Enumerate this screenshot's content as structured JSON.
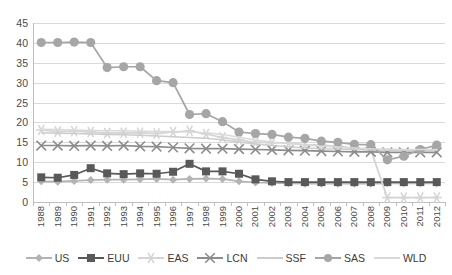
{
  "chart_data": {
    "type": "line",
    "title": "",
    "xlabel": "",
    "ylabel": "",
    "ylim": [
      0,
      45
    ],
    "ytick_step": 5,
    "grid": true,
    "legend_position": "bottom",
    "yticks": [
      "45",
      "40",
      "35",
      "30",
      "25",
      "20",
      "15",
      "10",
      "5",
      "0"
    ],
    "categories": [
      "1988",
      "1989",
      "1990",
      "1991",
      "1992",
      "1993",
      "1994",
      "1995",
      "1996",
      "1997",
      "1998",
      "1999",
      "2000",
      "2001",
      "2002",
      "2003",
      "2004",
      "2005",
      "2006",
      "2007",
      "2008",
      "2009",
      "2010",
      "2011",
      "2012"
    ],
    "series": [
      {
        "name": "US",
        "marker": "diamond",
        "color": "#b3b3b3",
        "values": [
          5.2,
          5.1,
          5.3,
          5.5,
          5.6,
          5.6,
          5.7,
          5.8,
          5.6,
          5.8,
          5.9,
          5.8,
          5.2,
          4.9,
          4.8,
          4.7,
          4.6,
          4.6,
          4.6,
          4.6,
          4.6,
          4.7,
          4.7,
          4.7,
          4.7
        ]
      },
      {
        "name": "EUU",
        "marker": "square",
        "color": "#595959",
        "values": [
          6.2,
          6.1,
          6.8,
          8.5,
          7.2,
          7.0,
          7.2,
          7.1,
          7.6,
          9.6,
          7.7,
          7.7,
          7.1,
          5.7,
          5.2,
          5.0,
          5.0,
          5.0,
          5.0,
          5.0,
          5.0,
          5.0,
          5.0,
          5.0,
          5.0
        ]
      },
      {
        "name": "EAS",
        "marker": "star",
        "color": "#d4d4d4",
        "values": [
          18.1,
          17.7,
          17.8,
          17.6,
          17.3,
          17.4,
          17.4,
          17.2,
          17.6,
          17.9,
          17.1,
          16.2,
          15.6,
          15.0,
          14.9,
          14.8,
          14.4,
          14.3,
          14.0,
          13.5,
          13.1,
          1.1,
          1.1,
          1.1,
          1.1
        ]
      },
      {
        "name": "LCN",
        "marker": "cross",
        "color": "#8c8c8c",
        "values": [
          14.2,
          14.2,
          14.1,
          14.2,
          14.1,
          14.2,
          14.0,
          13.9,
          13.7,
          13.5,
          13.4,
          13.4,
          13.3,
          13.2,
          13.1,
          13.0,
          12.9,
          12.8,
          12.7,
          12.6,
          12.6,
          12.5,
          12.5,
          12.5,
          12.5
        ]
      },
      {
        "name": "SSF",
        "marker": "none",
        "color": "#cccccc",
        "values": [
          17.4,
          17.3,
          17.2,
          17.1,
          17.0,
          16.9,
          16.8,
          16.6,
          16.4,
          16.2,
          16.0,
          15.6,
          15.1,
          14.6,
          14.2,
          13.9,
          13.6,
          13.4,
          13.3,
          13.2,
          13.1,
          13.0,
          13.0,
          13.0,
          13.0
        ]
      },
      {
        "name": "SAS",
        "marker": "circle",
        "color": "#a6a6a6",
        "values": [
          40.1,
          40.1,
          40.2,
          40.1,
          33.8,
          34.0,
          34.0,
          30.5,
          30.0,
          22.0,
          22.2,
          20.2,
          17.6,
          17.2,
          17.0,
          16.3,
          16.0,
          15.3,
          15.0,
          14.5,
          14.4,
          10.6,
          11.5,
          13.2,
          14.3
        ]
      },
      {
        "name": "WLD",
        "marker": "none",
        "color": "#d9d9d9",
        "values": [
          18.3,
          18.2,
          18.1,
          18.0,
          17.9,
          17.9,
          17.8,
          17.7,
          17.7,
          17.6,
          17.4,
          17.0,
          16.3,
          15.6,
          15.1,
          14.7,
          14.3,
          14.0,
          13.8,
          13.6,
          13.4,
          13.3,
          13.2,
          13.2,
          13.2
        ]
      }
    ]
  }
}
